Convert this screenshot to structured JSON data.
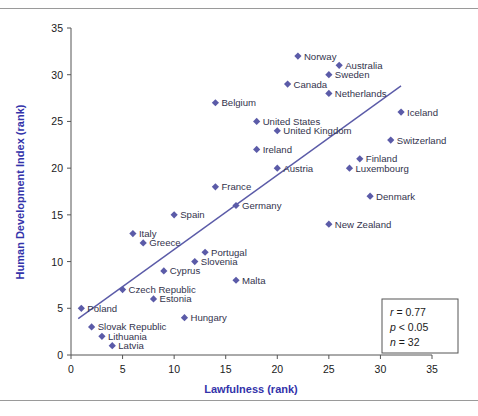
{
  "chart_data": {
    "type": "scatter",
    "title": "",
    "xlabel": "Lawfulness (rank)",
    "ylabel": "Human Development Index (rank)",
    "xlim": [
      0,
      35
    ],
    "ylim": [
      0,
      35
    ],
    "xticks": [
      0,
      5,
      10,
      15,
      20,
      25,
      30,
      35
    ],
    "yticks": [
      0,
      5,
      10,
      15,
      20,
      25,
      30,
      35
    ],
    "grid": false,
    "legend": false,
    "marker_color": "#5b5ba8",
    "line_color": "#5b5ba8",
    "axis_title_color": "#3333aa",
    "trendline": {
      "x1": 0.7,
      "y1": 3.9,
      "x2": 32.0,
      "y2": 28.8
    },
    "points": [
      {
        "label": "Norway",
        "x": 22,
        "y": 32,
        "lx": 6,
        "ly": 3.5
      },
      {
        "label": "Australia",
        "x": 26,
        "y": 31,
        "lx": 6,
        "ly": 3.5
      },
      {
        "label": "Sweden",
        "x": 25,
        "y": 30,
        "lx": 6,
        "ly": 3.5
      },
      {
        "label": "Canada",
        "x": 21,
        "y": 29,
        "lx": 6,
        "ly": 3.5
      },
      {
        "label": "Netherlands",
        "x": 25,
        "y": 28,
        "lx": 6,
        "ly": 3.5
      },
      {
        "label": "Belgium",
        "x": 14,
        "y": 27,
        "lx": 6,
        "ly": 3.5
      },
      {
        "label": "Iceland",
        "x": 32,
        "y": 26,
        "lx": 6,
        "ly": 3.5
      },
      {
        "label": "United States",
        "x": 18,
        "y": 25,
        "lx": 6,
        "ly": 3.5
      },
      {
        "label": "United Kingdom",
        "x": 20,
        "y": 24,
        "lx": 6,
        "ly": 3.5
      },
      {
        "label": "Switzerland",
        "x": 31,
        "y": 23,
        "lx": 6,
        "ly": 3.5
      },
      {
        "label": "Ireland",
        "x": 18,
        "y": 22,
        "lx": 6,
        "ly": 3.5
      },
      {
        "label": "Finland",
        "x": 28,
        "y": 21,
        "lx": 6,
        "ly": 3.5
      },
      {
        "label": "Austria",
        "x": 20,
        "y": 20,
        "lx": 6,
        "ly": 3.5
      },
      {
        "label": "Luxembourg",
        "x": 27,
        "y": 20,
        "lx": 6,
        "ly": 3.5
      },
      {
        "label": "France",
        "x": 14,
        "y": 18,
        "lx": 6,
        "ly": 3.5
      },
      {
        "label": "Denmark",
        "x": 29,
        "y": 17,
        "lx": 6,
        "ly": 3.5
      },
      {
        "label": "Germany",
        "x": 16,
        "y": 16,
        "lx": 6,
        "ly": 3.5
      },
      {
        "label": "Spain",
        "x": 10,
        "y": 15,
        "lx": 6,
        "ly": 3.5
      },
      {
        "label": "New Zealand",
        "x": 25,
        "y": 14,
        "lx": 6,
        "ly": 3.5
      },
      {
        "label": "Italy",
        "x": 6,
        "y": 13,
        "lx": 6,
        "ly": 3.5
      },
      {
        "label": "Greece",
        "x": 7,
        "y": 12,
        "lx": 6,
        "ly": 3.5
      },
      {
        "label": "Portugal",
        "x": 13,
        "y": 11,
        "lx": 6,
        "ly": 3.5
      },
      {
        "label": "Slovenia",
        "x": 12,
        "y": 10,
        "lx": 6,
        "ly": 3.5
      },
      {
        "label": "Cyprus",
        "x": 9,
        "y": 9,
        "lx": 6,
        "ly": 3.5
      },
      {
        "label": "Malta",
        "x": 16,
        "y": 8,
        "lx": 6,
        "ly": 3.5
      },
      {
        "label": "Czech Republic",
        "x": 5,
        "y": 7,
        "lx": 6,
        "ly": 3.5
      },
      {
        "label": "Estonia",
        "x": 8,
        "y": 6,
        "lx": 6,
        "ly": 3.5
      },
      {
        "label": "Poland",
        "x": 1,
        "y": 5,
        "lx": 6,
        "ly": 3.5
      },
      {
        "label": "Hungary",
        "x": 11,
        "y": 4,
        "lx": 6,
        "ly": 3.5
      },
      {
        "label": "Slovak Republic",
        "x": 2,
        "y": 3,
        "lx": 6,
        "ly": 3.5
      },
      {
        "label": "Lithuania",
        "x": 3,
        "y": 2,
        "lx": 6,
        "ly": 3.5
      },
      {
        "label": "Latvia",
        "x": 4,
        "y": 1,
        "lx": 6,
        "ly": 3.5
      }
    ],
    "annotations": {
      "r": "r = 0.77",
      "p": "p < 0.05",
      "n": "n = 32"
    }
  }
}
